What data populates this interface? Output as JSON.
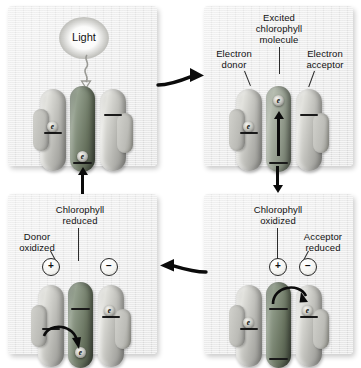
{
  "diagram": {
    "background_color": "#ffffff",
    "panel_color": "#e6e6e6",
    "chlorophyll_color": "#68735f",
    "protein_color": "#b6b6b1"
  },
  "panels": [
    {
      "id": "panel-1",
      "step": "1",
      "labels": {
        "light": "Light"
      },
      "icons": [
        "light-glow-icon",
        "photon-squiggle-arrow-icon"
      ],
      "chlorophyll_state": "ground",
      "electrons": [
        {
          "location": "donor",
          "symbol": "e"
        },
        {
          "location": "chlorophyll-bottom",
          "symbol": "e"
        }
      ],
      "charges": []
    },
    {
      "id": "panel-2",
      "step": "2",
      "labels": {
        "excited": "Excited\nchlorophyll\nmolecule",
        "donor": "Electron\ndonor",
        "acceptor": "Electron\nacceptor"
      },
      "icons": [
        "up-arrow-icon"
      ],
      "chlorophyll_state": "excited",
      "electrons": [
        {
          "location": "donor",
          "symbol": "e"
        },
        {
          "location": "chlorophyll-top",
          "symbol": "e"
        }
      ],
      "charges": []
    },
    {
      "id": "panel-3",
      "step": "3",
      "labels": {
        "chlorophyll_oxidized": "Chlorophyll\noxidized",
        "acceptor_reduced": "Acceptor\nreduced"
      },
      "icons": [
        "curved-electron-transfer-arrow-icon"
      ],
      "chlorophyll_state": "oxidized",
      "electrons": [
        {
          "location": "donor",
          "symbol": "e"
        },
        {
          "location": "acceptor",
          "symbol": "e"
        }
      ],
      "charges": [
        {
          "location": "chlorophyll",
          "sign": "+"
        },
        {
          "location": "acceptor",
          "sign": "−"
        }
      ]
    },
    {
      "id": "panel-4",
      "step": "4",
      "labels": {
        "chlorophyll_reduced": "Chlorophyll\nreduced",
        "donor_oxidized": "Donor\noxidized"
      },
      "icons": [
        "curved-electron-transfer-arrow-icon"
      ],
      "chlorophyll_state": "reduced",
      "electrons": [
        {
          "location": "chlorophyll-bottom",
          "symbol": "e"
        },
        {
          "location": "acceptor",
          "symbol": "e"
        }
      ],
      "charges": [
        {
          "location": "donor",
          "sign": "+"
        },
        {
          "location": "acceptor",
          "sign": "−"
        }
      ]
    }
  ],
  "flow_arrows": [
    {
      "name": "arrow-panel1-to-panel2",
      "direction": "right"
    },
    {
      "name": "arrow-panel2-to-panel3",
      "direction": "down"
    },
    {
      "name": "arrow-panel3-to-panel4",
      "direction": "left"
    },
    {
      "name": "arrow-panel4-to-panel1",
      "direction": "up"
    }
  ]
}
